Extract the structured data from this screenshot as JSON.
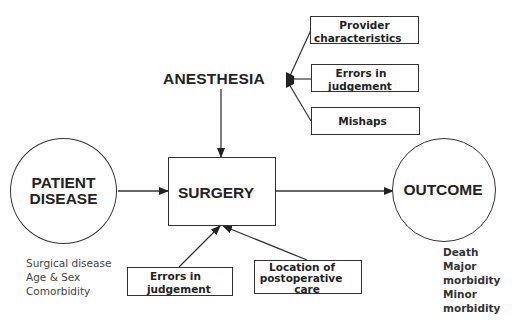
{
  "diagram": {
    "anesthesia": {
      "label": "ANESTHESIA"
    },
    "anesthesia_factors": [
      {
        "line1": "Provider",
        "line2": "characteristics"
      },
      {
        "line1": "Errors in",
        "line2": "judgement"
      },
      {
        "line1": "Mishaps",
        "line2": ""
      }
    ],
    "patient": {
      "line1": "PATIENT",
      "line2": "DISEASE",
      "factors": [
        "Surgical disease",
        "Age & Sex",
        "Comorbidity"
      ]
    },
    "surgery": {
      "label": "SURGERY"
    },
    "surgery_factors": [
      {
        "line1": "Errors in",
        "line2": "judgement",
        "line3": ""
      },
      {
        "line1": "Location of",
        "line2": "postoperative",
        "line3": "care"
      }
    ],
    "outcome": {
      "label": "OUTCOME",
      "results": [
        "Death",
        "Major",
        "morbidity",
        "Minor",
        "morbidity"
      ]
    },
    "colors": {
      "stroke": "#333333",
      "text": "#222222",
      "background": "#ffffff"
    }
  }
}
